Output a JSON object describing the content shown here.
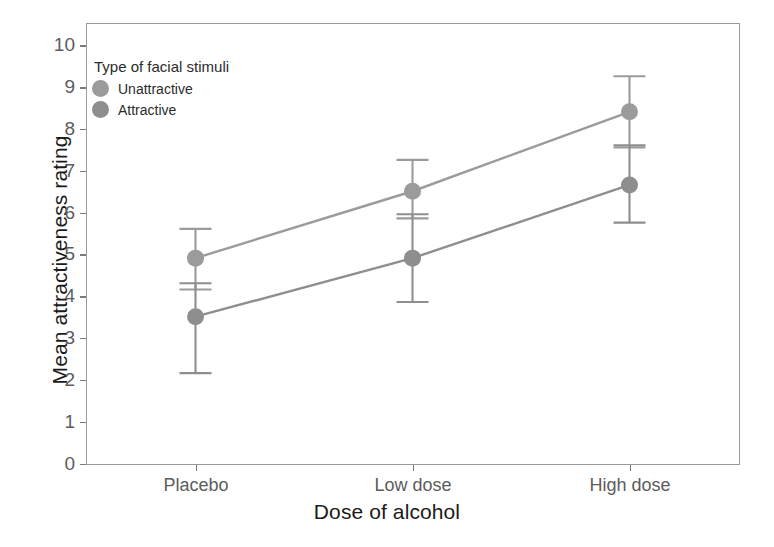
{
  "chart_data": {
    "type": "line",
    "title": "",
    "xlabel": "Dose of alcohol",
    "ylabel": "Mean attractiveness rating",
    "categories": [
      "Placebo",
      "Low dose",
      "High dose"
    ],
    "ylim": [
      0,
      10.5
    ],
    "yticks": [
      0,
      1,
      2,
      3,
      4,
      5,
      6,
      7,
      8,
      9,
      10
    ],
    "grid": false,
    "legend": {
      "title": "Type of facial stimuli",
      "position": "inside-top-left",
      "entries": [
        {
          "name": "Unattractive",
          "color": "#9b9b9b"
        },
        {
          "name": "Attractive",
          "color": "#8e8e8e"
        }
      ]
    },
    "series": [
      {
        "name": "Unattractive",
        "color": "#9b9b9b",
        "values": [
          4.9,
          6.5,
          8.4
        ],
        "err_low": [
          4.15,
          5.85,
          7.55
        ],
        "err_high": [
          5.6,
          7.25,
          9.25
        ]
      },
      {
        "name": "Attractive",
        "color": "#8e8e8e",
        "values": [
          3.5,
          4.9,
          6.65
        ],
        "err_low": [
          2.15,
          3.85,
          5.75
        ],
        "err_high": [
          4.3,
          5.95,
          7.6
        ]
      }
    ],
    "ytick_labels": [
      "0",
      "1",
      "2",
      "3",
      "4",
      "5",
      "6",
      "7",
      "8",
      "9",
      "10"
    ],
    "xtick_labels": [
      "Placebo",
      "Low dose",
      "High dose"
    ]
  },
  "style": {
    "panel_border": "#9a9a9a",
    "tick_color": "#7a7a7a",
    "axis_text": "#5c5c5c",
    "title_text": "#1b1b1b",
    "background": "#ffffff"
  }
}
